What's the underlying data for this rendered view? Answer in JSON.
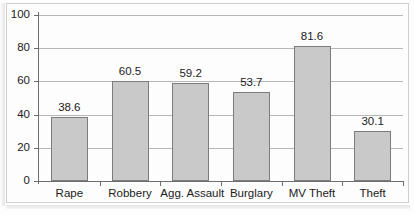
{
  "chart_data": {
    "type": "bar",
    "title": "",
    "subtitle": "",
    "xlabel": "",
    "ylabel": "",
    "categories": [
      "Rape",
      "Robbery",
      "Agg. Assault",
      "Burglary",
      "MV Theft",
      "Theft"
    ],
    "values": [
      38.6,
      60.5,
      59.2,
      53.7,
      81.6,
      30.1
    ],
    "value_labels": [
      "38.6",
      "60.5",
      "59.2",
      "53.7",
      "81.6",
      "30.1"
    ],
    "ylim": [
      0,
      100
    ],
    "yticks": [
      0,
      20,
      40,
      60,
      80,
      100
    ],
    "ytick_labels": [
      "0",
      "20",
      "40",
      "60",
      "80",
      "100"
    ],
    "grid": true,
    "grid_axis": "y",
    "legend": false,
    "legend_position": "none",
    "series": [
      {
        "name": "",
        "values": [
          38.6,
          60.5,
          59.2,
          53.7,
          81.6,
          30.1
        ]
      }
    ],
    "colors": {
      "bar_fill": "#c9c9c9",
      "bar_border": "#7c7c7c",
      "gridline": "#b6b6b6",
      "axis": "#6e6e6e",
      "text": "#1b1b1b",
      "background": "#ffffff",
      "frame": "#cfcfcf"
    }
  }
}
